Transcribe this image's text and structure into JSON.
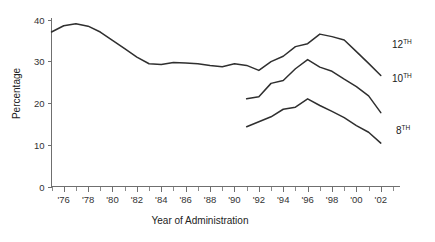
{
  "chart_data": {
    "type": "line",
    "title": "",
    "xlabel": "Year of Administration",
    "ylabel": "Percentage",
    "ylim": [
      0,
      40
    ],
    "xlim": [
      1975,
      2003
    ],
    "grid": false,
    "legend_position": "right-of-line-ends",
    "y_ticks": [
      "0",
      "10",
      "20",
      "30",
      "40"
    ],
    "y_tick_values": [
      0,
      10,
      20,
      30,
      40
    ],
    "x_tick_labels": [
      "'76",
      "'78",
      "'80",
      "'82",
      "'84",
      "'86",
      "'88",
      "'90",
      "'92",
      "'94",
      "'96",
      "'98",
      "'00",
      "'02"
    ],
    "x_tick_label_values": [
      1976,
      1978,
      1980,
      1982,
      1984,
      1986,
      1988,
      1990,
      1992,
      1994,
      1996,
      1998,
      2000,
      2002
    ],
    "x_minor_ticks": [
      1975,
      1976,
      1977,
      1978,
      1979,
      1980,
      1981,
      1982,
      1983,
      1984,
      1985,
      1986,
      1987,
      1988,
      1989,
      1990,
      1991,
      1992,
      1993,
      1994,
      1995,
      1996,
      1997,
      1998,
      1999,
      2000,
      2001,
      2002,
      2003
    ],
    "series": [
      {
        "name": "12TH",
        "label_main": "12",
        "label_sup": "TH",
        "x": [
          1975,
          1976,
          1977,
          1978,
          1979,
          1980,
          1981,
          1982,
          1983,
          1984,
          1985,
          1986,
          1987,
          1988,
          1989,
          1990,
          1991,
          1992,
          1993,
          1994,
          1995,
          1996,
          1997,
          1998,
          1999,
          2000,
          2001,
          2002
        ],
        "values": [
          37.0,
          38.5,
          39.0,
          38.4,
          37.0,
          35.0,
          33.0,
          31.0,
          29.4,
          29.2,
          29.7,
          29.6,
          29.4,
          29.0,
          28.7,
          29.4,
          29.0,
          27.8,
          29.9,
          31.2,
          33.5,
          34.2,
          36.5,
          35.9,
          35.1,
          32.3,
          29.5,
          26.6
        ]
      },
      {
        "name": "10TH",
        "label_main": "10",
        "label_sup": "TH",
        "x": [
          1991,
          1992,
          1993,
          1994,
          1995,
          1996,
          1997,
          1998,
          1999,
          2000,
          2001,
          2002
        ],
        "values": [
          21.0,
          21.5,
          24.7,
          25.4,
          28.2,
          30.4,
          28.6,
          27.6,
          25.7,
          23.9,
          21.7,
          17.7
        ]
      },
      {
        "name": "8TH",
        "label_main": "8",
        "label_sup": "TH",
        "x": [
          1991,
          1992,
          1993,
          1994,
          1995,
          1996,
          1997,
          1998,
          1999,
          2000,
          2001,
          2002
        ],
        "values": [
          14.3,
          15.5,
          16.7,
          18.5,
          19.0,
          21.0,
          19.4,
          18.0,
          16.5,
          14.6,
          13.0,
          10.4
        ]
      }
    ]
  },
  "colors": {
    "line": "#2f2f2f",
    "axis": "#6f6f6f",
    "text": "#222222",
    "background": "#ffffff"
  }
}
